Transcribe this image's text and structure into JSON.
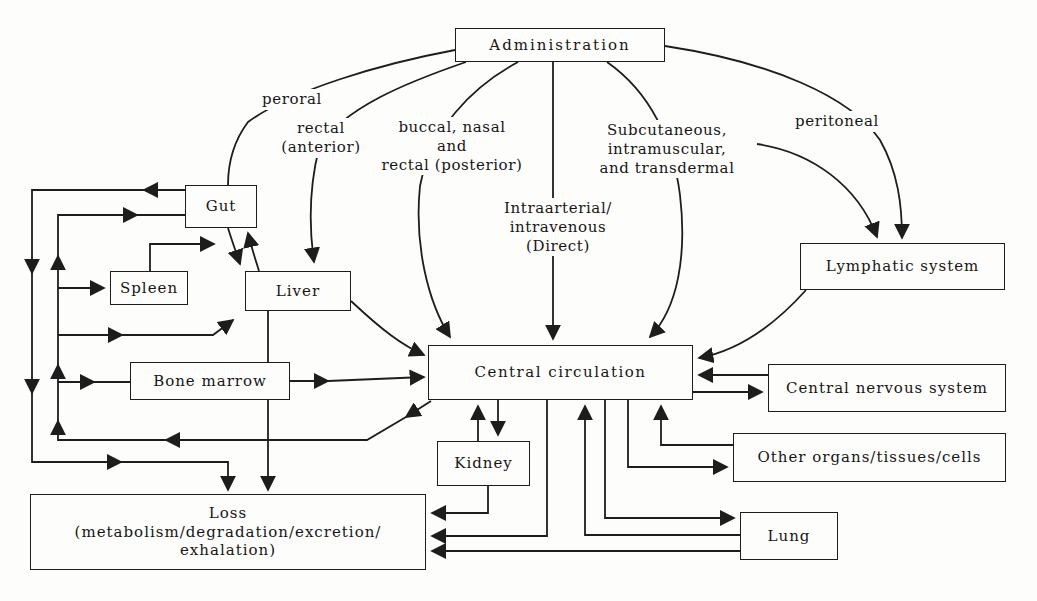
{
  "figure": {
    "line_color": "#1d1d1d",
    "background_color": "#fdfdfb"
  },
  "nodes": {
    "administration": {
      "label": "Administration"
    },
    "gut": {
      "label": "Gut"
    },
    "spleen": {
      "label": "Spleen"
    },
    "liver": {
      "label": "Liver"
    },
    "bone_marrow": {
      "label": "Bone marrow"
    },
    "central_circulation": {
      "label": "Central circulation"
    },
    "kidney": {
      "label": "Kidney"
    },
    "loss": {
      "label": "Loss\n(metabolism/degradation/excretion/\nexhalation)"
    },
    "lymphatic_system": {
      "label": "Lymphatic system"
    },
    "central_nervous_system": {
      "label": "Central nervous system"
    },
    "other_organs": {
      "label": "Other organs/tissues/cells"
    },
    "lung": {
      "label": "Lung"
    }
  },
  "route_labels": {
    "peroral": {
      "label": "peroral"
    },
    "rectal_anterior": {
      "label": "rectal\n(anterior)"
    },
    "buccal_nasal_rectal": {
      "label": "buccal, nasal\nand\nrectal (posterior)"
    },
    "intraarterial": {
      "label": "Intraarterial/\nintravenous\n(Direct)"
    },
    "subcutaneous": {
      "label": "Subcutaneous,\nintramuscular,\nand transdermal"
    },
    "peritoneal": {
      "label": "peritoneal"
    }
  },
  "edges": [
    {
      "from": "administration",
      "to": "gut",
      "via": "peroral"
    },
    {
      "from": "administration",
      "to": "liver",
      "via": "rectal (anterior)"
    },
    {
      "from": "administration",
      "to": "central_circulation",
      "via": "buccal, nasal and rectal (posterior)"
    },
    {
      "from": "administration",
      "to": "central_circulation",
      "via": "intraarterial/intravenous (direct)"
    },
    {
      "from": "administration",
      "to": "central_circulation",
      "via": "subcutaneous, intramuscular, and transdermal"
    },
    {
      "from": "administration",
      "to": "lymphatic_system",
      "via": "subcutaneous, intramuscular, and transdermal"
    },
    {
      "from": "administration",
      "to": "lymphatic_system",
      "via": "peritoneal"
    },
    {
      "from": "lymphatic_system",
      "to": "central_circulation"
    },
    {
      "from": "central_circulation",
      "to": "central_nervous_system"
    },
    {
      "from": "central_nervous_system",
      "to": "central_circulation"
    },
    {
      "from": "central_circulation",
      "to": "other_organs"
    },
    {
      "from": "other_organs",
      "to": "central_circulation"
    },
    {
      "from": "central_circulation",
      "to": "lung"
    },
    {
      "from": "lung",
      "to": "central_circulation"
    },
    {
      "from": "central_circulation",
      "to": "kidney"
    },
    {
      "from": "kidney",
      "to": "central_circulation"
    },
    {
      "from": "kidney",
      "to": "loss"
    },
    {
      "from": "central_circulation",
      "to": "loss"
    },
    {
      "from": "lung",
      "to": "loss"
    },
    {
      "from": "central_circulation",
      "to": "gut"
    },
    {
      "from": "central_circulation",
      "to": "spleen"
    },
    {
      "from": "central_circulation",
      "to": "liver"
    },
    {
      "from": "central_circulation",
      "to": "bone_marrow"
    },
    {
      "from": "bone_marrow",
      "to": "central_circulation"
    },
    {
      "from": "liver",
      "to": "central_circulation"
    },
    {
      "from": "gut",
      "to": "liver"
    },
    {
      "from": "liver",
      "to": "gut"
    },
    {
      "from": "spleen",
      "to": "liver"
    },
    {
      "from": "liver",
      "to": "loss"
    },
    {
      "from": "gut",
      "to": "loss"
    }
  ]
}
